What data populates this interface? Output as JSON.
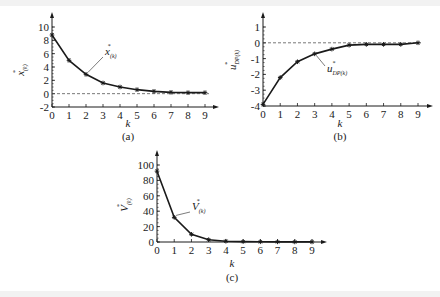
{
  "chart_data": [
    {
      "type": "line",
      "panel": "(a)",
      "title": "",
      "xlabel": "k",
      "ylabel": "x*(k)",
      "annotation": "x*(k)",
      "x": [
        0,
        1,
        2,
        3,
        4,
        5,
        6,
        7,
        8,
        9
      ],
      "values": [
        8.8,
        5.0,
        2.9,
        1.6,
        1.0,
        0.6,
        0.35,
        0.2,
        0.15,
        0.15
      ],
      "xticks": [
        "0",
        "1",
        "2",
        "3",
        "4",
        "5",
        "6",
        "7",
        "8",
        "9"
      ],
      "yticks": [
        "-2",
        "0",
        "2",
        "4",
        "6",
        "8",
        "10"
      ],
      "ylim": [
        -2,
        10
      ],
      "reference_line": {
        "y": 0,
        "style": "dashed"
      },
      "marker": "asterisk",
      "grid": false
    },
    {
      "type": "line",
      "panel": "(b)",
      "title": "",
      "xlabel": "k",
      "ylabel": "u*DP(k)",
      "annotation": "u*DP(k)",
      "x": [
        0,
        1,
        2,
        3,
        4,
        5,
        6,
        7,
        8,
        9
      ],
      "values": [
        -3.9,
        -2.2,
        -1.2,
        -0.7,
        -0.4,
        -0.15,
        -0.1,
        -0.1,
        -0.1,
        0.0
      ],
      "xticks": [
        "0",
        "1",
        "2",
        "3",
        "4",
        "5",
        "6",
        "7",
        "8",
        "9"
      ],
      "yticks": [
        "-4",
        "-3",
        "-2",
        "-1",
        "0",
        "1"
      ],
      "ylim": [
        -4,
        1
      ],
      "reference_line": {
        "y": 0,
        "style": "dashed"
      },
      "marker": "asterisk",
      "grid": false
    },
    {
      "type": "line",
      "panel": "(c)",
      "title": "",
      "xlabel": "k",
      "ylabel": "V*(k)",
      "annotation": "V*(k)",
      "x": [
        0,
        1,
        2,
        3,
        4,
        5,
        6,
        7,
        8,
        9
      ],
      "values": [
        92,
        32,
        10,
        3,
        1,
        0.5,
        0.3,
        0.2,
        0.1,
        0.1
      ],
      "xticks": [
        "0",
        "1",
        "2",
        "3",
        "4",
        "5",
        "6",
        "7",
        "8",
        "9"
      ],
      "yticks": [
        "0",
        "20",
        "40",
        "60",
        "80",
        "100"
      ],
      "ylim": [
        0,
        100
      ],
      "marker": "asterisk",
      "grid": false
    }
  ],
  "labels": {
    "a": {
      "caption": "(a)",
      "xlabel": "k",
      "ylabel_main": "x",
      "ylabel_sub": "(k)",
      "annot_main": "x",
      "annot_sub": "(k)"
    },
    "b": {
      "caption": "(b)",
      "xlabel": "k",
      "ylabel_main": "u",
      "ylabel_sub": "DP(k)",
      "annot_main": "u",
      "annot_sub": "DP(k)"
    },
    "c": {
      "caption": "(c)",
      "xlabel": "k",
      "ylabel_main": "V",
      "ylabel_sub": "(k)",
      "annot_main": "V",
      "annot_sub": "(k)"
    }
  },
  "star": "*"
}
